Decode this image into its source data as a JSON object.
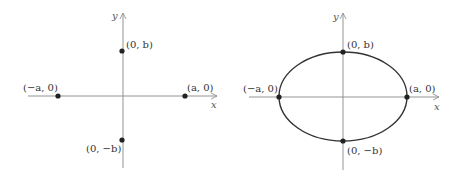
{
  "panels": [
    {
      "id": "left",
      "description": "Vertices and co-vertices plotted on axes",
      "origin": [
        123,
        96
      ],
      "axis_labels": {
        "x": "x",
        "y": "y"
      },
      "points": [
        {
          "label": "(0, b)",
          "px": [
            122,
            51
          ]
        },
        {
          "label": "(−a, 0)",
          "px": [
            58,
            96
          ]
        },
        {
          "label": "(a, 0)",
          "px": [
            185,
            96
          ]
        },
        {
          "label": "(0, −b)",
          "px": [
            122,
            140
          ]
        }
      ],
      "ellipse": false
    },
    {
      "id": "right",
      "description": "Ellipse through the four points",
      "origin": [
        343,
        97
      ],
      "axis_labels": {
        "x": "x",
        "y": "y"
      },
      "points": [
        {
          "label": "(0, b)",
          "px": [
            343,
            52
          ]
        },
        {
          "label": "(−a, 0)",
          "px": [
            278,
            97
          ]
        },
        {
          "label": "(a, 0)",
          "px": [
            406,
            97
          ]
        },
        {
          "label": "(0, −b)",
          "px": [
            343,
            141
          ]
        }
      ],
      "ellipse": true,
      "ellipse_rx": 64,
      "ellipse_ry": 45
    }
  ],
  "colors": {
    "axis": "#888888",
    "curve": "#333333",
    "point": "#222222",
    "text": "#333333"
  }
}
